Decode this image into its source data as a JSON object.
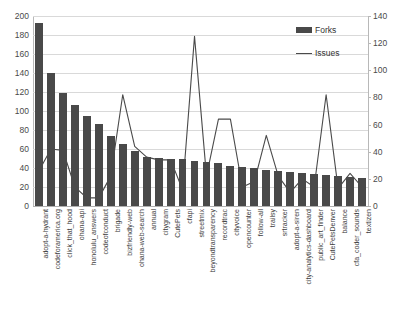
{
  "chart_data": {
    "type": "bar",
    "title": "",
    "subtitle": "",
    "xlabel": "",
    "ylabel": "",
    "y2label": "",
    "grid": true,
    "legend_position": "top-right",
    "ylim": [
      0,
      200
    ],
    "y2lim": [
      0,
      140
    ],
    "yticks": [
      0,
      20,
      40,
      60,
      80,
      100,
      120,
      140,
      160,
      180,
      200
    ],
    "y2ticks": [
      0,
      20,
      40,
      60,
      80,
      100,
      120,
      140
    ],
    "categories": [
      "adopt-a-hydrant",
      "codeforamerica.org",
      "click_that_hood",
      "ohana-api",
      "honolulu_answers",
      "codeofconduct",
      "brigade",
      "bizfriendly-web",
      "ohana-web-search",
      "annual",
      "citygram",
      "CutePets",
      "cfapi",
      "streetmix",
      "beyondtransparency",
      "recordtrac",
      "cityvoice",
      "opencounter",
      "follow-all",
      "trailsy",
      "srtracker",
      "adopt-a-siren",
      "city-analytics-dashboard",
      "public_art_finder",
      "CutePetsDenver",
      "balance",
      "cfa_coder_sounds",
      "textizen"
    ],
    "series": [
      {
        "name": "Forks",
        "type": "bar",
        "axis": "left",
        "color": "#494949",
        "values": [
          193,
          140,
          119,
          106,
          95,
          86,
          74,
          65,
          58,
          52,
          51,
          50,
          49,
          47,
          46,
          45,
          42,
          41,
          40,
          38,
          37,
          36,
          35,
          34,
          33,
          32,
          31,
          30
        ]
      },
      {
        "name": "Issues",
        "type": "line",
        "axis": "right",
        "color": "#4a4a4a",
        "values": [
          26,
          42,
          41,
          14,
          6,
          6,
          22,
          82,
          44,
          36,
          34,
          34,
          12,
          125,
          22,
          64,
          64,
          14,
          18,
          52,
          22,
          10,
          20,
          14,
          82,
          13,
          24,
          14
        ]
      }
    ]
  },
  "legend": {
    "forks_label": "Forks",
    "issues_label": "Issues"
  }
}
